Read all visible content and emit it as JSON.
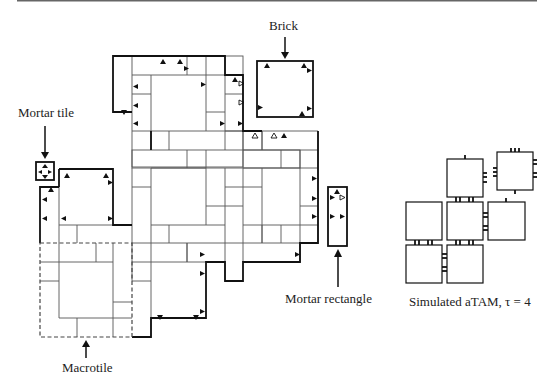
{
  "figure": {
    "labels": {
      "brick": "Brick",
      "mortar_tile": "Mortar tile",
      "mortar_rectangle": "Mortar rectangle",
      "macrotile": "Macrotile",
      "simulated": "Simulated aTAM, τ = 4"
    },
    "colors": {
      "line": "#111111",
      "grid": "#555555",
      "background": "#ffffff"
    }
  }
}
